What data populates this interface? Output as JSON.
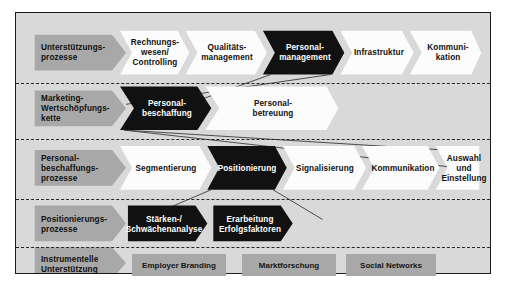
{
  "diagram": {
    "colors": {
      "frame_bg": "#d9d9d9",
      "frame_border": "#1a1a1a",
      "label_arrow": "#a8a8a8",
      "chevron_white": "#fcfcfc",
      "chevron_black": "#111111",
      "divider": "#262626"
    },
    "rows": [
      {
        "id": "unterstuetzungsprozesse",
        "label": "Unterstützungs-\nprozesse",
        "items": [
          {
            "label": "Rechnungs-\nwesen/\nControlling",
            "style": "white"
          },
          {
            "label": "Qualitäts-\nmanagement",
            "style": "white"
          },
          {
            "label": "Personal-\nmanagement",
            "style": "black"
          },
          {
            "label": "Infrastruktur",
            "style": "white"
          },
          {
            "label": "Kommuni-\nkation",
            "style": "white"
          }
        ]
      },
      {
        "id": "marketing-wertschoepfungskette",
        "label": "Marketing-\nWertschöpfungs-\nkette",
        "items": [
          {
            "label": "Personal-\nbeschaffung",
            "style": "black"
          },
          {
            "label": "Personal-\nbetreuung",
            "style": "white"
          }
        ]
      },
      {
        "id": "personalbeschaffungsprozesse",
        "label": "Personal-\nbeschaffungs-\nprozesse",
        "items": [
          {
            "label": "Segmentierung",
            "style": "white"
          },
          {
            "label": "Positionierung",
            "style": "black"
          },
          {
            "label": "Signalisierung",
            "style": "white"
          },
          {
            "label": "Kommunikation",
            "style": "white"
          },
          {
            "label": "Auswahl und\nEinstellung",
            "style": "white"
          }
        ]
      },
      {
        "id": "positionierungsprozesse",
        "label": "Positionierungs-\nprozesse",
        "items": [
          {
            "label": "Stärken-/\nSchwächenanalyse",
            "style": "black"
          },
          {
            "label": "Erarbeitung\nErfolgsfaktoren",
            "style": "black"
          }
        ]
      },
      {
        "id": "instrumentelle-unterstuetzung",
        "label": "Instrumentelle\nUnterstützung",
        "items": [
          {
            "label": "Employer Branding",
            "style": "gray"
          },
          {
            "label": "Marktforschung",
            "style": "gray"
          },
          {
            "label": "Social Networks",
            "style": "gray"
          }
        ]
      }
    ]
  }
}
